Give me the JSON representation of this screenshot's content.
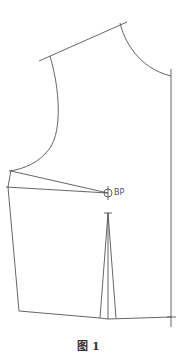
{
  "diagram": {
    "type": "garment-pattern-front-bodice",
    "stroke_color": "#555555",
    "labels": {
      "bust_point": "BP"
    },
    "caption": "图 1"
  }
}
